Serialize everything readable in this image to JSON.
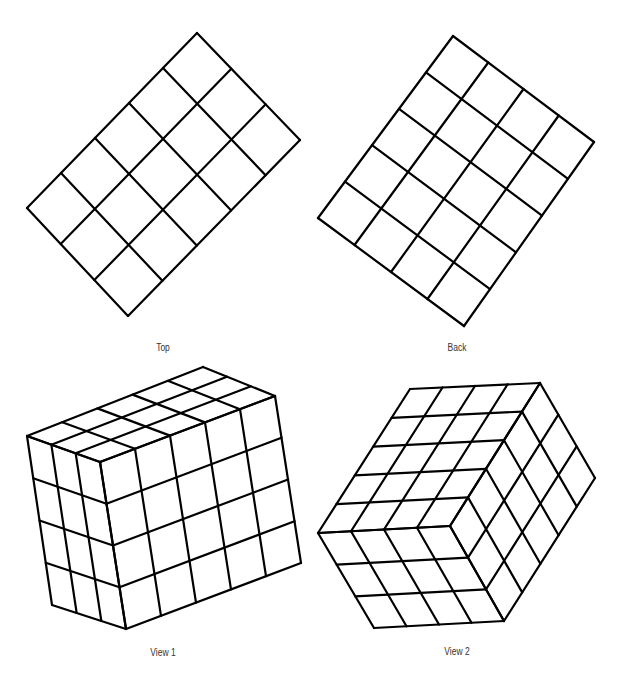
{
  "stroke": {
    "color": "#000000",
    "width": 2.2
  },
  "figures": [
    {
      "id": "top",
      "label": "Top",
      "label_pos": [
        163,
        347
      ],
      "faces": [
        {
          "name": "top-grid",
          "corners": [
            [
              197,
              33
            ],
            [
              300,
              140
            ],
            [
              128,
              316
            ],
            [
              27,
              208
            ]
          ],
          "cols": 3,
          "rows": 5
        }
      ]
    },
    {
      "id": "back",
      "label": "Back",
      "label_pos": [
        457,
        347
      ],
      "faces": [
        {
          "name": "back-grid",
          "corners": [
            [
              453,
              36
            ],
            [
              594,
              142
            ],
            [
              464,
              326
            ],
            [
              318,
              218
            ]
          ],
          "cols": 4,
          "rows": 5
        }
      ]
    },
    {
      "id": "view1",
      "label": "View 1",
      "label_pos": [
        163,
        652
      ],
      "faces": [
        {
          "name": "view1-top-face",
          "corners": [
            [
              27,
              436
            ],
            [
              203,
              367
            ],
            [
              275,
              396
            ],
            [
              100,
              462
            ]
          ],
          "cols": 5,
          "rows": 3
        },
        {
          "name": "view1-front-face",
          "corners": [
            [
              100,
              462
            ],
            [
              275,
              396
            ],
            [
              301,
              563
            ],
            [
              126,
              629
            ]
          ],
          "cols": 5,
          "rows": 4
        },
        {
          "name": "view1-left-face",
          "corners": [
            [
              27,
              436
            ],
            [
              100,
              462
            ],
            [
              126,
              629
            ],
            [
              52,
              605
            ]
          ],
          "cols": 3,
          "rows": 4
        }
      ]
    },
    {
      "id": "view2",
      "label": "View 2",
      "label_pos": [
        457,
        651
      ],
      "faces": [
        {
          "name": "view2-top-face",
          "corners": [
            [
              410,
              389
            ],
            [
              540,
              383
            ],
            [
              450,
              526
            ],
            [
              318,
              533
            ]
          ],
          "cols": 4,
          "rows": 5,
          "quad_order": "tl-tr-br-bl"
        },
        {
          "name": "view2-right-face",
          "corners": [
            [
              450,
              526
            ],
            [
              540,
              383
            ],
            [
              595,
              478
            ],
            [
              504,
              621
            ]
          ],
          "cols": 5,
          "rows": 3
        },
        {
          "name": "view2-front-face",
          "corners": [
            [
              318,
              533
            ],
            [
              450,
              526
            ],
            [
              504,
              621
            ],
            [
              374,
              628
            ]
          ],
          "cols": 4,
          "rows": 3
        }
      ]
    }
  ]
}
